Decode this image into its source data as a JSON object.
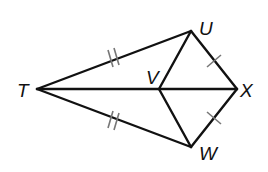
{
  "diagram": {
    "type": "geometry-kite",
    "colors": {
      "stroke": "#111111",
      "tick": "#777777",
      "background": "#ffffff"
    },
    "points": {
      "T": {
        "label": "T",
        "x": 37,
        "y": 89
      },
      "U": {
        "label": "U",
        "x": 191,
        "y": 31
      },
      "V": {
        "label": "V",
        "x": 159,
        "y": 89
      },
      "X": {
        "label": "X",
        "x": 237,
        "y": 89
      },
      "W": {
        "label": "W",
        "x": 191,
        "y": 147
      }
    },
    "segments": [
      {
        "from": "T",
        "to": "U",
        "ticks": 2
      },
      {
        "from": "T",
        "to": "W",
        "ticks": 2
      },
      {
        "from": "U",
        "to": "X",
        "ticks": 1
      },
      {
        "from": "W",
        "to": "X",
        "ticks": 1
      },
      {
        "from": "T",
        "to": "X",
        "ticks": 0
      },
      {
        "from": "U",
        "to": "V",
        "ticks": 0
      },
      {
        "from": "V",
        "to": "W",
        "ticks": 0
      }
    ],
    "congruences": [
      "TU ≅ TW",
      "UX ≅ WX"
    ]
  }
}
